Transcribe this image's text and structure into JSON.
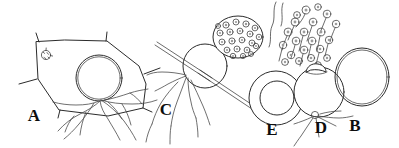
{
  "figure": {
    "background_color": "#ffffff",
    "ink_color": "#2b2b2b",
    "label_color": "#0d0d0d",
    "width": 399,
    "height": 148,
    "style": "scientific line drawing / ink illustration"
  },
  "panels": [
    {
      "id": "A",
      "label": "A",
      "label_x": 34,
      "label_y": 121,
      "caption_text": "A",
      "description": "polygonal host plant cell containing a stippled spherical oospore with radiating hyphae",
      "elements": {
        "host_cell": "polygonal outline",
        "oospore": "stippled sphere",
        "hyphae": "branching filaments",
        "small_body": "small circular structure at upper-left wall"
      }
    },
    {
      "id": "B",
      "label": "B",
      "label_x": 355,
      "label_y": 131,
      "caption_text": "B",
      "description": "mature oospore, densely stippled thick-walled sphere"
    },
    {
      "id": "C",
      "label": "C",
      "label_x": 166,
      "label_y": 115,
      "caption_text": "C",
      "description": "sporangium on hypha with adjacent cell packed with rounded zoospore initials, crossed by straight needle-like structures"
    },
    {
      "id": "D",
      "label": "D",
      "label_x": 321,
      "label_y": 133,
      "caption_text": "D",
      "description": "sporangium with apical papilla discharging flagellate zoospores, basal hyphae"
    },
    {
      "id": "E",
      "label": "E",
      "label_x": 272,
      "label_y": 135,
      "caption_text": "E",
      "description": "double-walled oospore shown as concentric circles"
    }
  ],
  "zoospores": {
    "description": "cluster of released flagellate zoospores above panel D",
    "count": 22,
    "has_flagella": true
  }
}
